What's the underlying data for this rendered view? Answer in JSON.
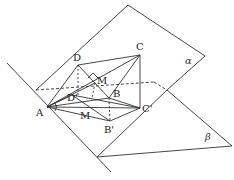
{
  "diagram": {
    "type": "geometry-dihedral-planes",
    "planes": [
      {
        "label": "α",
        "pos": [
          160,
          64
        ]
      },
      {
        "label": "β",
        "pos": [
          200,
          140
        ]
      }
    ],
    "points": [
      {
        "id": "A",
        "label": "A",
        "xy": [
          47,
          107
        ],
        "label_pos": [
          36,
          116
        ]
      },
      {
        "id": "D",
        "label": "D",
        "xy": [
          78,
          65
        ],
        "label_pos": [
          73,
          61
        ]
      },
      {
        "id": "C",
        "label": "C",
        "xy": [
          140,
          55
        ],
        "label_pos": [
          136,
          50
        ]
      },
      {
        "id": "M",
        "label": "M",
        "xy": [
          95,
          83
        ],
        "label_pos": [
          97,
          84
        ]
      },
      {
        "id": "B",
        "label": "B",
        "xy": [
          109,
          98
        ],
        "label_pos": [
          113,
          96
        ]
      },
      {
        "id": "C2",
        "label": "C'",
        "xy": [
          140,
          108
        ],
        "label_pos": [
          142,
          112
        ]
      },
      {
        "id": "D2",
        "label": "D'",
        "xy": [
          72,
          95
        ],
        "label_pos": [
          67,
          100
        ]
      },
      {
        "id": "M2",
        "label": "M",
        "xy": [
          85,
          110
        ],
        "label_pos": [
          80,
          119
        ]
      },
      {
        "id": "B2",
        "label": "B'",
        "xy": [
          110,
          121
        ],
        "label_pos": [
          104,
          133
        ]
      }
    ],
    "colors": {
      "stroke": "#333333",
      "background": "#ffffff"
    }
  }
}
